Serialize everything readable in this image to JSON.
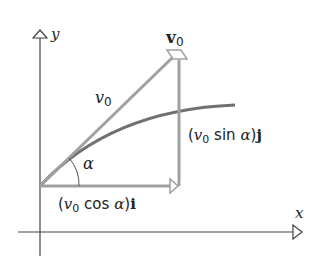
{
  "diagram": {
    "type": "projectile-velocity-decomposition",
    "axes": {
      "x_label": "x",
      "y_label": "y"
    },
    "vectors": {
      "initial_velocity": {
        "label_bold": "v",
        "label_sub": "0"
      },
      "speed": {
        "label_italic": "v",
        "label_sub": "0"
      },
      "horizontal_component": {
        "open": "(",
        "v": "v",
        "sub": "0",
        "func": " cos ",
        "angle": "α",
        "close": ")",
        "unit": "i"
      },
      "vertical_component": {
        "open": "(",
        "v": "v",
        "sub": "0",
        "func": " sin ",
        "angle": "α",
        "close": ")",
        "unit": "j"
      }
    },
    "angle_label": "α",
    "colors": {
      "axis": "#444444",
      "vector": "#a0a0a0",
      "trajectory": "#707070",
      "text": "#222222"
    }
  }
}
